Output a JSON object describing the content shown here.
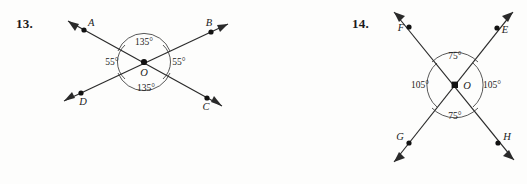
{
  "page": {
    "background": "#fdfdfc",
    "ink_color": "#1b1b1b",
    "line_color": "#2a2a2a"
  },
  "problems": [
    {
      "number": "13.",
      "vertex_label": "O",
      "points": [
        {
          "label": "A",
          "position": "upper-left"
        },
        {
          "label": "B",
          "position": "upper-right"
        },
        {
          "label": "C",
          "position": "lower-right"
        },
        {
          "label": "D",
          "position": "lower-left"
        }
      ],
      "angles": [
        {
          "label": "135°",
          "value": 135,
          "position": "top"
        },
        {
          "label": "55°",
          "value": 55,
          "position": "left"
        },
        {
          "label": "55°",
          "value": 55,
          "position": "right"
        },
        {
          "label": "135°",
          "value": 135,
          "position": "bottom"
        }
      ]
    },
    {
      "number": "14.",
      "vertex_label": "O",
      "points": [
        {
          "label": "F",
          "position": "upper-left"
        },
        {
          "label": "E",
          "position": "upper-right"
        },
        {
          "label": "H",
          "position": "lower-right"
        },
        {
          "label": "G",
          "position": "lower-left"
        }
      ],
      "angles": [
        {
          "label": "75°",
          "value": 75,
          "position": "top"
        },
        {
          "label": "105°",
          "value": 105,
          "position": "left"
        },
        {
          "label": "105°",
          "value": 105,
          "position": "right"
        },
        {
          "label": "75°",
          "value": 75,
          "position": "bottom"
        }
      ]
    }
  ]
}
